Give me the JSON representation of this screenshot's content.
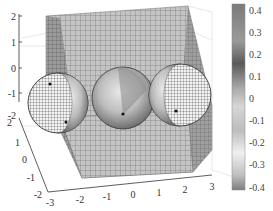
{
  "chart_data": {
    "type": "surface3d",
    "title": "",
    "axes": {
      "x": {
        "ticks": [
          "-3",
          "-2",
          "-1",
          "0",
          "1",
          "2",
          "3"
        ],
        "range": [
          -3,
          3
        ]
      },
      "y": {
        "ticks": [
          "-2",
          "-1",
          "0",
          "1",
          "2"
        ],
        "range": [
          -2,
          2
        ]
      },
      "z": {
        "ticks": [
          "-2",
          "-1",
          "0",
          "1",
          "2"
        ],
        "range": [
          -2,
          2
        ]
      }
    },
    "objects": [
      {
        "kind": "plane",
        "orientation": "vertical"
      },
      {
        "kind": "plane",
        "orientation": "horizontal"
      },
      {
        "kind": "sphere",
        "center_x": -2,
        "style": "wireframe+surface"
      },
      {
        "kind": "sphere",
        "center_x": 0,
        "style": "surface"
      },
      {
        "kind": "sphere",
        "center_x": 2,
        "style": "surface+wireframe"
      }
    ],
    "colorbar": {
      "ticks": [
        "0.4",
        "0.3",
        "0.2",
        "0.1",
        "0",
        "-0.1",
        "-0.2",
        "-0.3",
        "-0.4"
      ],
      "range": [
        -0.4,
        0.4
      ],
      "colormap": "gray"
    },
    "grid": true,
    "legend": "none"
  }
}
